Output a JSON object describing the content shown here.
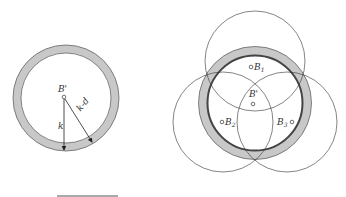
{
  "left_figure": {
    "center_label": "B'",
    "radius_label": "k",
    "inner_radius_label": "k-d"
  },
  "right_figure": {
    "center_label": "B'",
    "beacons": [
      {
        "label": "B",
        "sub": "1"
      },
      {
        "label": "B",
        "sub": "2"
      },
      {
        "label": "B",
        "sub": "3"
      }
    ]
  },
  "colors": {
    "ring_fill": "#c8c8c8",
    "ring_stroke": "#555555",
    "circle_stroke": "#333333"
  }
}
